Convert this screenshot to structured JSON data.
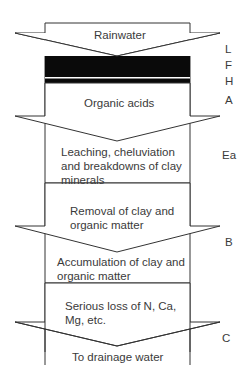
{
  "diagram": {
    "steps": [
      {
        "text": "Rainwater"
      },
      {
        "text": "Organic acids"
      },
      {
        "text": "Leaching, cheluviation and breakdowns of clay minerals",
        "lines": [
          "Leaching, cheluviation",
          "and breakdowns of clay",
          "minerals"
        ]
      },
      {
        "text": "Removal of clay and organic matter",
        "lines": [
          "Removal of clay and",
          "organic matter"
        ]
      },
      {
        "text": "Accumulation of clay and organic matter",
        "lines": [
          "Accumulation of clay and",
          "organic matter"
        ]
      },
      {
        "text": "Serious loss of N, Ca, Mg, etc.",
        "lines": [
          "Serious loss of N, Ca,",
          "Mg, etc."
        ]
      },
      {
        "text": "To drainage water"
      }
    ],
    "horizons": [
      "L",
      "F",
      "H",
      "A",
      "Ea",
      "B",
      "C"
    ],
    "colors": {
      "line": "#333333",
      "organic_band": "#0a0a0a"
    }
  }
}
